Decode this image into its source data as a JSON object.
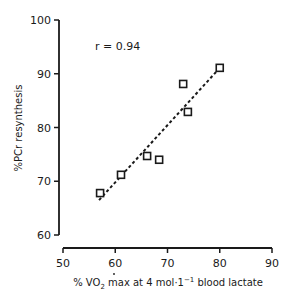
{
  "chart_data": {
    "type": "scatter",
    "title": "",
    "xlabel": "% VO2 max at 4 mol·1⁻¹ blood lactate",
    "xlabel_parts": {
      "prefix": "% V",
      "sub_base": "O",
      "sub": "2",
      "suffix": " max at 4 mol·1",
      "sup": "−1",
      "tail": " blood lactate"
    },
    "ylabel": "%PCr resynthesis",
    "xlim": [
      50,
      90
    ],
    "ylim": [
      60,
      100
    ],
    "xticks": [
      50,
      60,
      70,
      80,
      90
    ],
    "yticks": [
      60,
      70,
      80,
      90,
      100
    ],
    "grid": false,
    "legend": null,
    "annotation": "r = 0.94",
    "series": [
      {
        "name": "subjects",
        "marker": "open-square",
        "points": [
          {
            "x": 57.1,
            "y": 67.8
          },
          {
            "x": 61.1,
            "y": 71.2
          },
          {
            "x": 66.1,
            "y": 74.7
          },
          {
            "x": 68.4,
            "y": 74.0
          },
          {
            "x": 73.0,
            "y": 88.1
          },
          {
            "x": 73.9,
            "y": 82.9
          },
          {
            "x": 80.0,
            "y": 91.1
          }
        ]
      }
    ],
    "regression_line": {
      "style": "dashed",
      "from": {
        "x": 56.9,
        "y": 66.5
      },
      "to": {
        "x": 80.4,
        "y": 91.5
      }
    }
  },
  "labels": {
    "annotation": "r = 0.94",
    "ylabel": "%PCr resynthesis"
  },
  "colors": {
    "ink": "#1a1a1a",
    "background": "#ffffff"
  }
}
